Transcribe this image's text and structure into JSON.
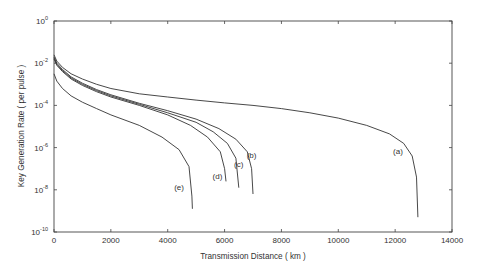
{
  "chart_data": {
    "type": "line",
    "title": "",
    "xlabel": "Transmission Distance ( km )",
    "ylabel": "Key Generation Rate ( per pulse )",
    "xlim": [
      0,
      14000
    ],
    "ylim": [
      1e-10,
      1
    ],
    "yscale": "log",
    "grid": false,
    "x_ticks": [
      0,
      2000,
      4000,
      6000,
      8000,
      10000,
      12000,
      14000
    ],
    "y_ticks": [
      {
        "exp": "0",
        "value": 1
      },
      {
        "exp": "-2",
        "value": 0.01
      },
      {
        "exp": "-4",
        "value": 0.0001
      },
      {
        "exp": "-6",
        "value": 1e-06
      },
      {
        "exp": "-8",
        "value": 1e-08
      },
      {
        "exp": "-10",
        "value": 1e-10
      }
    ],
    "series": [
      {
        "name": "(a)",
        "label_at": [
          12100,
          -6.3
        ],
        "points": [
          [
            0,
            -1.6
          ],
          [
            100,
            -1.9
          ],
          [
            300,
            -2.2
          ],
          [
            600,
            -2.5
          ],
          [
            1000,
            -2.75
          ],
          [
            1500,
            -3.0
          ],
          [
            2000,
            -3.2
          ],
          [
            3000,
            -3.45
          ],
          [
            4000,
            -3.6
          ],
          [
            5000,
            -3.75
          ],
          [
            6000,
            -3.88
          ],
          [
            7000,
            -4.0
          ],
          [
            8000,
            -4.15
          ],
          [
            9000,
            -4.35
          ],
          [
            10000,
            -4.6
          ],
          [
            11000,
            -4.95
          ],
          [
            11800,
            -5.35
          ],
          [
            12300,
            -5.8
          ],
          [
            12600,
            -6.4
          ],
          [
            12750,
            -7.4
          ],
          [
            12800,
            -9.3
          ]
        ]
      },
      {
        "name": "(b)",
        "label_at": [
          6950,
          -6.5
        ],
        "points": [
          [
            0,
            -1.7
          ],
          [
            100,
            -2.0
          ],
          [
            300,
            -2.3
          ],
          [
            600,
            -2.65
          ],
          [
            1000,
            -2.95
          ],
          [
            1500,
            -3.25
          ],
          [
            2000,
            -3.5
          ],
          [
            3000,
            -3.9
          ],
          [
            4000,
            -4.25
          ],
          [
            5000,
            -4.65
          ],
          [
            5800,
            -5.1
          ],
          [
            6400,
            -5.6
          ],
          [
            6800,
            -6.2
          ],
          [
            6950,
            -7.0
          ],
          [
            7000,
            -8.2
          ]
        ]
      },
      {
        "name": "(c)",
        "label_at": [
          6500,
          -6.9
        ],
        "points": [
          [
            0,
            -1.75
          ],
          [
            100,
            -2.05
          ],
          [
            300,
            -2.35
          ],
          [
            600,
            -2.7
          ],
          [
            1000,
            -3.0
          ],
          [
            1500,
            -3.3
          ],
          [
            2000,
            -3.55
          ],
          [
            3000,
            -3.95
          ],
          [
            4000,
            -4.35
          ],
          [
            5000,
            -4.8
          ],
          [
            5600,
            -5.25
          ],
          [
            6100,
            -5.8
          ],
          [
            6400,
            -6.5
          ],
          [
            6500,
            -7.9
          ]
        ]
      },
      {
        "name": "(d)",
        "label_at": [
          5750,
          -7.5
        ],
        "points": [
          [
            0,
            -1.8
          ],
          [
            100,
            -2.1
          ],
          [
            300,
            -2.4
          ],
          [
            600,
            -2.75
          ],
          [
            1000,
            -3.05
          ],
          [
            1500,
            -3.35
          ],
          [
            2000,
            -3.6
          ],
          [
            3000,
            -4.0
          ],
          [
            4000,
            -4.45
          ],
          [
            4800,
            -4.95
          ],
          [
            5400,
            -5.5
          ],
          [
            5850,
            -6.2
          ],
          [
            6000,
            -7.0
          ],
          [
            6050,
            -7.6
          ]
        ]
      },
      {
        "name": "(e)",
        "label_at": [
          4400,
          -8.0
        ],
        "points": [
          [
            0,
            -2.5
          ],
          [
            100,
            -2.85
          ],
          [
            300,
            -3.2
          ],
          [
            600,
            -3.55
          ],
          [
            1000,
            -3.85
          ],
          [
            1500,
            -4.15
          ],
          [
            2000,
            -4.45
          ],
          [
            3000,
            -4.95
          ],
          [
            3800,
            -5.5
          ],
          [
            4400,
            -6.1
          ],
          [
            4750,
            -6.9
          ],
          [
            4850,
            -8.3
          ],
          [
            4870,
            -8.9
          ]
        ]
      }
    ]
  }
}
